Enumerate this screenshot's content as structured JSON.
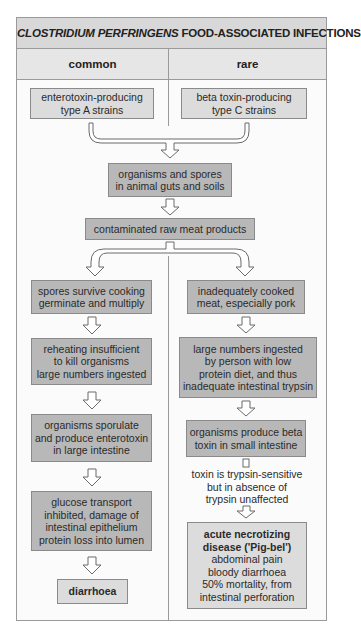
{
  "title": {
    "italic_part": "CLOSTRIDIUM PERFRINGENS",
    "rest": " FOOD-ASSOCIATED INFECTIONS"
  },
  "columns": {
    "left": "common",
    "right": "rare"
  },
  "sources": {
    "left": [
      "enterotoxin-producing",
      "type A strains"
    ],
    "right": [
      "beta toxin-producing",
      "type C strains"
    ]
  },
  "shared": {
    "reservoir": [
      "organisms and spores",
      "in animal guts and soils"
    ],
    "contamination": "contaminated raw meat products"
  },
  "common_path": {
    "step1": [
      "spores survive cooking",
      "germinate and multiply"
    ],
    "step2": [
      "reheating insufficient",
      "to kill organisms",
      "large numbers ingested"
    ],
    "step3": [
      "organisms sporulate",
      "and produce enterotoxin",
      "in large intestine"
    ],
    "step4": [
      "glucose transport",
      "inhibited, damage of",
      "intestinal epithelium",
      "protein loss into lumen"
    ],
    "outcome": "diarrhoea"
  },
  "rare_path": {
    "step1": [
      "inadequately cooked",
      "meat, especially pork"
    ],
    "step2": [
      "large numbers ingested",
      "by person with low",
      "protein diet, and thus",
      "inadequate intestinal trypsin"
    ],
    "step3": [
      "organisms produce beta",
      "toxin in small intestine"
    ],
    "note": [
      "toxin is trypsin-sensitive",
      "but in absence of",
      "trypsin unaffected"
    ],
    "outcome_title": [
      "acute necrotizing",
      "disease ('Pig-bel')"
    ],
    "outcome_details": [
      "abdominal pain",
      "bloody diarrhoea",
      "50% mortality, from",
      "intestinal perforation"
    ]
  }
}
